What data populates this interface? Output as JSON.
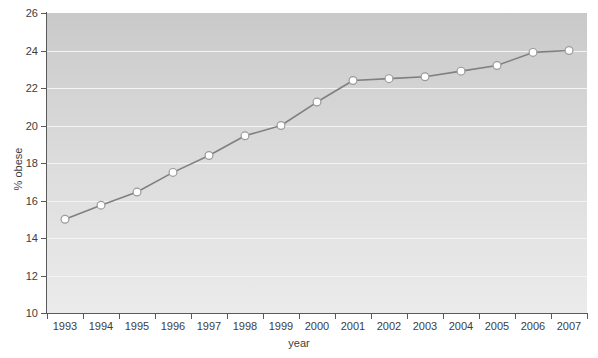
{
  "chart_data": {
    "type": "line",
    "title": "",
    "xlabel": "year",
    "ylabel": "% obese",
    "x": [
      1993,
      1994,
      1995,
      1996,
      1997,
      1998,
      1999,
      2000,
      2001,
      2002,
      2003,
      2004,
      2005,
      2006,
      2007
    ],
    "xtick_labels": [
      "1993",
      "1994",
      "1995",
      "1996",
      "1997",
      "1998",
      "1999",
      "2000",
      "2001",
      "2002",
      "2003",
      "2004",
      "2005",
      "2006",
      "2007"
    ],
    "values": [
      15.0,
      15.75,
      16.45,
      17.5,
      18.4,
      19.45,
      20.0,
      21.25,
      22.4,
      22.5,
      22.6,
      22.9,
      23.2,
      23.9,
      24.0
    ],
    "ylim": [
      10,
      26
    ],
    "yticks": [
      10,
      12,
      14,
      16,
      18,
      20,
      22,
      24,
      26
    ],
    "ytick_labels": [
      "10",
      "12",
      "14",
      "16",
      "18",
      "20",
      "22",
      "24",
      "26"
    ],
    "gridlines": [
      10,
      12,
      14,
      16,
      18,
      20,
      22,
      24
    ],
    "grid": true,
    "legend": null,
    "series_name": "% obese",
    "line_color": "#808080",
    "marker_fill": "#ffffff",
    "marker_edge": "#9a9a9a",
    "grid_color": "#f4f4f4",
    "axis_color": "#5a5a5a",
    "plot_bg_top": "#c9c9c9",
    "plot_bg_bottom": "#ebebeb",
    "figure_bg": "#ffffff"
  }
}
